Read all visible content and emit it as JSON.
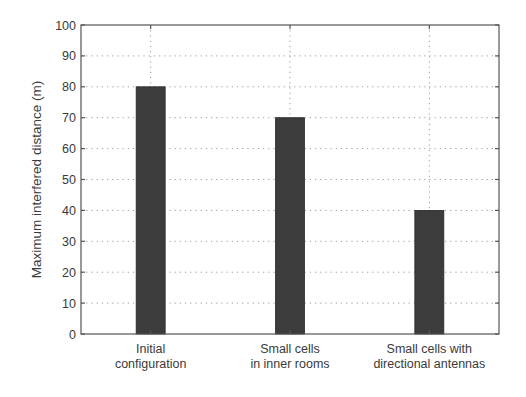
{
  "chart_data": {
    "type": "bar",
    "title": "",
    "xlabel": "",
    "ylabel": "Maximum interfered distance (m)",
    "categories": [
      [
        "Initial",
        "configuration"
      ],
      [
        "Small cells",
        "in inner rooms"
      ],
      [
        "Small cells with",
        "directional antennas"
      ]
    ],
    "category_names": [
      "Initial configuration",
      "Small cells in inner rooms",
      "Small cells with directional antennas"
    ],
    "values": [
      80,
      70,
      40
    ],
    "ylim": [
      0,
      100
    ],
    "yticks": [
      0,
      10,
      20,
      30,
      40,
      50,
      60,
      70,
      80,
      90,
      100
    ],
    "grid": true,
    "legend": null,
    "colors": {
      "bar": "#3c3c3c",
      "axis": "#555555",
      "grid": "#9a9a9a",
      "text": "#3a3a3a"
    }
  }
}
